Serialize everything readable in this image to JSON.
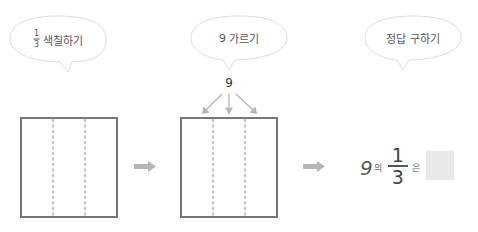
{
  "bubbles": [
    {
      "id": "shade",
      "fraction": {
        "numerator": "1",
        "denominator": "3"
      },
      "label": "색칠하기"
    },
    {
      "id": "divide",
      "prefix": "9",
      "label": "가르기"
    },
    {
      "id": "answer",
      "label": "정답 구하기"
    }
  ],
  "diagram": {
    "divisor_value": "9",
    "box_parts": 3
  },
  "answer_expression": {
    "whole": "9",
    "particle_of": "의",
    "fraction": {
      "numerator": "1",
      "denominator": "3"
    },
    "particle_topic": "은",
    "answer_value": ""
  },
  "colors": {
    "box_border": "#777777",
    "dashed_line": "#888888",
    "arrow": "#b5b5b5",
    "bubble_border": "#d9d9d9",
    "answer_box_fill": "#e8e8e8"
  }
}
